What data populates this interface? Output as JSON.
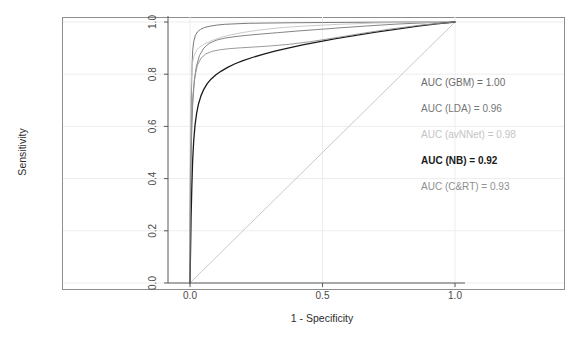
{
  "chart_data": {
    "type": "line",
    "title": "",
    "xlabel": "1 - Specificity",
    "ylabel": "Sensitivity",
    "xlim": [
      0,
      1
    ],
    "ylim": [
      0,
      1
    ],
    "xticks": [
      "0.0",
      "0.5",
      "1.0"
    ],
    "xtick_values": [
      0.0,
      0.5,
      1.0
    ],
    "yticks": [
      "0.0",
      "0.2",
      "0.4",
      "0.6",
      "0.8",
      "1.0"
    ],
    "ytick_values": [
      0.0,
      0.2,
      0.4,
      0.6,
      0.8,
      1.0
    ],
    "grid": true,
    "legend_position": "right-inside",
    "reference_line": {
      "name": "chance-diagonal",
      "from": [
        0,
        0
      ],
      "to": [
        1,
        1
      ],
      "color": "#c9c9c9"
    },
    "series": [
      {
        "name": "GBM",
        "auc": "1.00",
        "legend_text": "AUC (GBM) = 1.00",
        "color": "#6b6b6b",
        "width": 0.9,
        "points": [
          [
            0.0,
            0.0
          ],
          [
            0.0,
            0.26
          ],
          [
            0.002,
            0.48
          ],
          [
            0.004,
            0.64
          ],
          [
            0.006,
            0.76
          ],
          [
            0.008,
            0.84
          ],
          [
            0.01,
            0.89
          ],
          [
            0.014,
            0.925
          ],
          [
            0.02,
            0.948
          ],
          [
            0.028,
            0.962
          ],
          [
            0.04,
            0.972
          ],
          [
            0.055,
            0.979
          ],
          [
            0.075,
            0.984
          ],
          [
            0.1,
            0.988
          ],
          [
            0.13,
            0.991
          ],
          [
            0.17,
            0.993
          ],
          [
            0.22,
            0.995
          ],
          [
            0.29,
            0.996
          ],
          [
            0.38,
            0.997
          ],
          [
            0.5,
            0.998
          ],
          [
            0.65,
            0.999
          ],
          [
            0.82,
            1.0
          ],
          [
            1.0,
            1.0
          ]
        ]
      },
      {
        "name": "LDA",
        "auc": "0.96",
        "legend_text": "AUC (LDA) = 0.96",
        "color": "#777777",
        "width": 0.9,
        "points": [
          [
            0.0,
            0.0
          ],
          [
            0.001,
            0.2
          ],
          [
            0.003,
            0.4
          ],
          [
            0.006,
            0.56
          ],
          [
            0.01,
            0.68
          ],
          [
            0.016,
            0.77
          ],
          [
            0.024,
            0.83
          ],
          [
            0.036,
            0.872
          ],
          [
            0.052,
            0.9
          ],
          [
            0.072,
            0.918
          ],
          [
            0.098,
            0.93
          ],
          [
            0.13,
            0.938
          ],
          [
            0.17,
            0.944
          ],
          [
            0.215,
            0.949
          ],
          [
            0.27,
            0.954
          ],
          [
            0.33,
            0.959
          ],
          [
            0.4,
            0.965
          ],
          [
            0.48,
            0.971
          ],
          [
            0.57,
            0.978
          ],
          [
            0.67,
            0.985
          ],
          [
            0.78,
            0.992
          ],
          [
            0.89,
            0.997
          ],
          [
            1.0,
            1.0
          ]
        ]
      },
      {
        "name": "avNNet",
        "auc": "0.98",
        "legend_text": "AUC (avNNet) = 0.98",
        "color": "#c4c4c4",
        "width": 0.9,
        "points": [
          [
            0.0,
            0.0
          ],
          [
            0.0,
            0.3
          ],
          [
            0.001,
            0.52
          ],
          [
            0.002,
            0.66
          ],
          [
            0.004,
            0.745
          ],
          [
            0.006,
            0.8
          ],
          [
            0.009,
            0.838
          ],
          [
            0.013,
            0.862
          ],
          [
            0.018,
            0.878
          ],
          [
            0.024,
            0.89
          ],
          [
            0.032,
            0.9
          ],
          [
            0.042,
            0.908
          ],
          [
            0.055,
            0.916
          ],
          [
            0.072,
            0.924
          ],
          [
            0.093,
            0.933
          ],
          [
            0.12,
            0.942
          ],
          [
            0.155,
            0.951
          ],
          [
            0.2,
            0.96
          ],
          [
            0.26,
            0.969
          ],
          [
            0.34,
            0.978
          ],
          [
            0.44,
            0.985
          ],
          [
            0.56,
            0.991
          ],
          [
            0.7,
            0.996
          ],
          [
            0.86,
            0.999
          ],
          [
            1.0,
            1.0
          ]
        ]
      },
      {
        "name": "NB",
        "auc": "0.92",
        "legend_text": "AUC (NB) = 0.92",
        "color": "#1a1a1a",
        "width": 1.3,
        "points": [
          [
            0.0,
            0.0
          ],
          [
            0.002,
            0.12
          ],
          [
            0.004,
            0.25
          ],
          [
            0.007,
            0.37
          ],
          [
            0.01,
            0.47
          ],
          [
            0.014,
            0.545
          ],
          [
            0.019,
            0.605
          ],
          [
            0.025,
            0.65
          ],
          [
            0.032,
            0.686
          ],
          [
            0.041,
            0.716
          ],
          [
            0.052,
            0.742
          ],
          [
            0.065,
            0.764
          ],
          [
            0.08,
            0.782
          ],
          [
            0.098,
            0.798
          ],
          [
            0.118,
            0.812
          ],
          [
            0.142,
            0.826
          ],
          [
            0.17,
            0.84
          ],
          [
            0.2,
            0.852
          ],
          [
            0.235,
            0.864
          ],
          [
            0.275,
            0.876
          ],
          [
            0.32,
            0.888
          ],
          [
            0.37,
            0.9
          ],
          [
            0.425,
            0.912
          ],
          [
            0.485,
            0.924
          ],
          [
            0.55,
            0.936
          ],
          [
            0.62,
            0.948
          ],
          [
            0.695,
            0.96
          ],
          [
            0.775,
            0.972
          ],
          [
            0.86,
            0.984
          ],
          [
            0.93,
            0.993
          ],
          [
            1.0,
            1.0
          ]
        ]
      },
      {
        "name": "C&RT",
        "auc": "0.93",
        "legend_text": "AUC (C&RT) = 0.93",
        "color": "#8f8f8f",
        "width": 0.9,
        "points": [
          [
            0.0,
            0.0
          ],
          [
            0.001,
            0.25
          ],
          [
            0.003,
            0.47
          ],
          [
            0.006,
            0.62
          ],
          [
            0.011,
            0.72
          ],
          [
            0.018,
            0.79
          ],
          [
            0.028,
            0.835
          ],
          [
            0.042,
            0.862
          ],
          [
            0.06,
            0.878
          ],
          [
            0.085,
            0.888
          ],
          [
            0.115,
            0.894
          ],
          [
            0.15,
            0.898
          ],
          [
            0.19,
            0.901
          ],
          [
            0.24,
            0.904
          ],
          [
            0.3,
            0.908
          ],
          [
            0.37,
            0.914
          ],
          [
            0.45,
            0.924
          ],
          [
            0.54,
            0.938
          ],
          [
            0.64,
            0.955
          ],
          [
            0.75,
            0.972
          ],
          [
            0.87,
            0.988
          ],
          [
            1.0,
            1.0
          ]
        ]
      }
    ]
  }
}
